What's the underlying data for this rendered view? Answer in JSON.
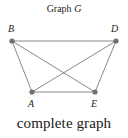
{
  "title": {
    "text": "Graph ",
    "variable": "G"
  },
  "caption": "complete graph",
  "colors": {
    "edge": "#8a8a8a",
    "vertex": "#707070",
    "text": "#231f20"
  },
  "vertices": [
    {
      "id": "B",
      "label": "B",
      "x": 12,
      "y": 41,
      "lx": 8,
      "ly": 32
    },
    {
      "id": "D",
      "label": "D",
      "x": 116,
      "y": 41,
      "lx": 111,
      "ly": 32
    },
    {
      "id": "A",
      "label": "A",
      "x": 32,
      "y": 92,
      "lx": 28,
      "ly": 107
    },
    {
      "id": "E",
      "label": "E",
      "x": 95,
      "y": 92,
      "lx": 91,
      "ly": 107
    }
  ],
  "edges": [
    [
      "B",
      "D"
    ],
    [
      "B",
      "A"
    ],
    [
      "B",
      "E"
    ],
    [
      "D",
      "A"
    ],
    [
      "D",
      "E"
    ],
    [
      "A",
      "E"
    ]
  ]
}
